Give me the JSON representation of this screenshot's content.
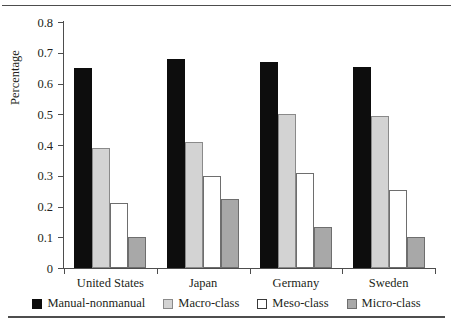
{
  "chart_data": {
    "type": "bar",
    "title": "",
    "xlabel": "",
    "ylabel": "Percentage",
    "ylim": [
      0,
      0.8
    ],
    "yticks": [
      "0",
      "0.1",
      "0.2",
      "0.3",
      "0.4",
      "0.5",
      "0.6",
      "0.7",
      "0.8"
    ],
    "ytick_values": [
      0,
      0.1,
      0.2,
      0.3,
      0.4,
      0.5,
      0.6,
      0.7,
      0.8
    ],
    "grid": false,
    "legend_position": "bottom",
    "categories": [
      "United States",
      "Japan",
      "Germany",
      "Sweden"
    ],
    "series": [
      {
        "name": "Manual-nonmanual",
        "color": "#0d0d0d",
        "values": [
          0.65,
          0.68,
          0.67,
          0.655
        ]
      },
      {
        "name": "Macro-class",
        "color": "#d3d3d3",
        "values": [
          0.39,
          0.41,
          0.5,
          0.495
        ]
      },
      {
        "name": "Meso-class",
        "color": "#ffffff",
        "values": [
          0.21,
          0.3,
          0.31,
          0.255
        ]
      },
      {
        "name": "Micro-class",
        "color": "#a8a8a8",
        "values": [
          0.1,
          0.225,
          0.135,
          0.1
        ]
      }
    ]
  }
}
